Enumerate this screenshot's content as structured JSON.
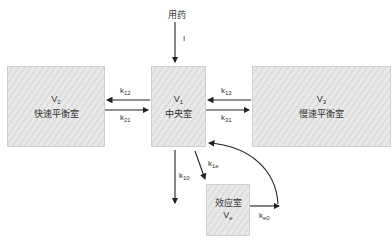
{
  "dose": {
    "label": "用药",
    "input_symbol": "I"
  },
  "compartments": {
    "peripheral_fast": {
      "volume": "V",
      "volume_sub": "2",
      "name": "快速平衡室"
    },
    "central": {
      "volume": "V",
      "volume_sub": "1",
      "name": "中央室"
    },
    "peripheral_slow": {
      "volume": "V",
      "volume_sub": "3",
      "name": "慢速平衡室"
    },
    "effect": {
      "name": "效应室",
      "volume": "V",
      "volume_sub": "e"
    }
  },
  "rate_constants": {
    "k12": {
      "base": "k",
      "sub": "12"
    },
    "k21": {
      "base": "k",
      "sub": "21"
    },
    "k13": {
      "base": "k",
      "sub": "13"
    },
    "k31": {
      "base": "k",
      "sub": "31"
    },
    "k10": {
      "base": "k",
      "sub": "10"
    },
    "k1e": {
      "base": "k",
      "sub": "1e"
    },
    "ke0": {
      "base": "k",
      "sub": "e0"
    }
  },
  "colors": {
    "box_fill": "#e4e4e4",
    "box_border": "#cfcfcf",
    "arrow": "#222222",
    "text": "#333333"
  }
}
